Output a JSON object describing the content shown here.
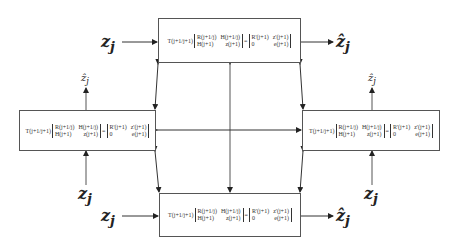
{
  "diagram": {
    "type": "block-diagram",
    "colors": {
      "line": "#555555",
      "text": "#333333",
      "background": "#ffffff"
    },
    "equation": {
      "prefix": "T(j+1/j+1)",
      "lhs_matrix": [
        [
          "R(j+1/j)",
          "H(j+1/j)"
        ],
        [
          "H(j+1)",
          "z(j+1)"
        ]
      ],
      "equals": "=",
      "rhs_matrix": [
        [
          "R'(j+1)",
          "z'(j+1)"
        ],
        [
          "0",
          "e(j+1)"
        ]
      ]
    },
    "blocks": [
      {
        "id": "top",
        "input_label": "z",
        "input_sub": "j",
        "output_label": "ẑ",
        "output_sub": "j"
      },
      {
        "id": "left",
        "input_label": "z",
        "input_sub": "j",
        "output_label": "ẑ",
        "output_sub": "j"
      },
      {
        "id": "right",
        "input_label": "z",
        "input_sub": "j",
        "output_label": "ẑ",
        "output_sub": "j"
      },
      {
        "id": "bottom",
        "input_label": "z",
        "input_sub": "j",
        "output_label": "ẑ",
        "output_sub": "j"
      }
    ]
  }
}
